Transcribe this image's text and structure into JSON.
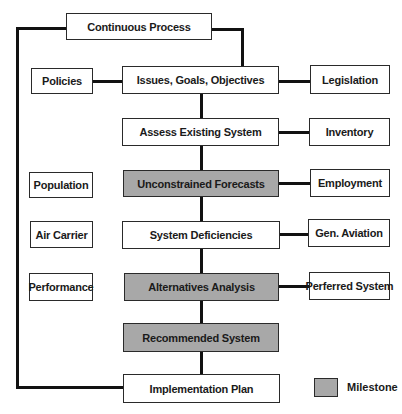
{
  "diagram": {
    "top": {
      "label": "Continuous Process"
    },
    "main_flow": [
      {
        "label": "Issues, Goals, Objectives",
        "milestone": false
      },
      {
        "label": "Assess Existing System",
        "milestone": false
      },
      {
        "label": "Unconstrained Forecasts",
        "milestone": true
      },
      {
        "label": "System Deficiencies",
        "milestone": false
      },
      {
        "label": "Alternatives Analysis",
        "milestone": true
      },
      {
        "label": "Recommended System",
        "milestone": true
      },
      {
        "label": "Implementation Plan",
        "milestone": false
      }
    ],
    "left_inputs": [
      {
        "label": "Policies"
      },
      {
        "label": "Population"
      },
      {
        "label": "Air Carrier"
      },
      {
        "label": "Performance"
      }
    ],
    "right_inputs": [
      {
        "label": "Legislation"
      },
      {
        "label": "Inventory"
      },
      {
        "label": "Employment"
      },
      {
        "label": "Gen. Aviation"
      },
      {
        "label": "Perferred System"
      }
    ],
    "legend": {
      "label": "Milestone",
      "color": "#a8a8a8"
    }
  },
  "colors": {
    "milestone_fill": "#a8a8a8",
    "box_fill": "#ffffff",
    "line": "#111111"
  }
}
